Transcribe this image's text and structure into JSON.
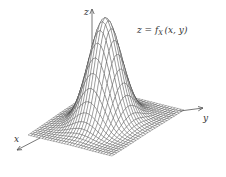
{
  "figure": {
    "formula": {
      "lhs": "z",
      "eq": " = ",
      "func": "f",
      "sub": "X",
      "args": "(x, y)"
    },
    "axes": {
      "x_label": "x",
      "y_label": "y",
      "z_label": "z"
    },
    "colors": {
      "mesh": "#3a3a3a",
      "axis": "#555555",
      "background": "#ffffff"
    }
  },
  "chart_data": {
    "type": "surface",
    "xlabel": "x",
    "ylabel": "y",
    "zlabel": "z",
    "surface": {
      "function": "gaussian",
      "grid_lines": 30,
      "x_range": [
        -3,
        3
      ],
      "y_range": [
        -3,
        3
      ],
      "sigma": 0.9,
      "peak": 1.0
    },
    "grid": true,
    "legend": false
  }
}
